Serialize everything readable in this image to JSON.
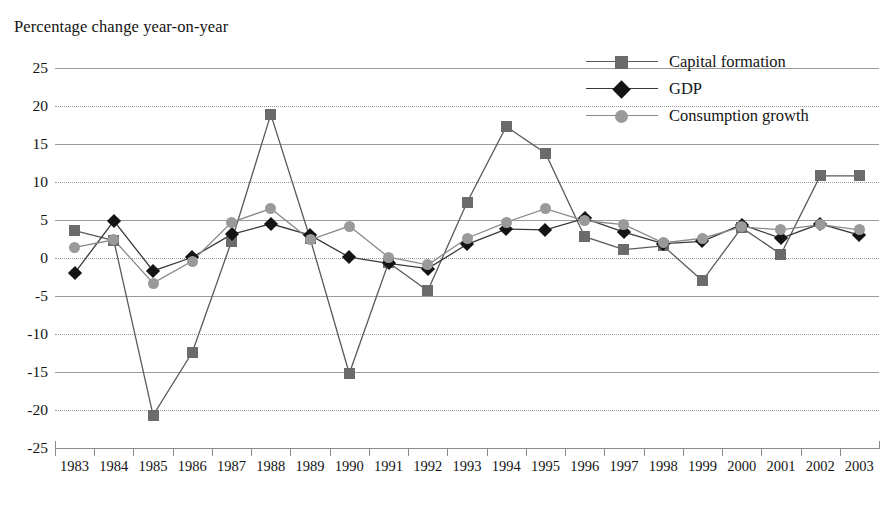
{
  "axis_title": "Percentage change year-on-year",
  "legend": {
    "position": "top-right",
    "items": [
      {
        "label": "Capital formation",
        "marker": "square",
        "color": "#6b6b6b",
        "line_color": "#5a5a5a"
      },
      {
        "label": "GDP",
        "marker": "diamond",
        "color": "#141414",
        "line_color": "#3a3a3a"
      },
      {
        "label": "Consumption growth",
        "marker": "circle",
        "color": "#9a9a9a",
        "line_color": "#8a8a8a"
      }
    ]
  },
  "yaxis": {
    "ticks": [
      "25",
      "20",
      "15",
      "10",
      "5",
      "0",
      "-5",
      "-10",
      "-15",
      "-20",
      "-25"
    ],
    "min": -25,
    "max": 25,
    "step": 5
  },
  "xaxis": {
    "ticks": [
      "1983",
      "1984",
      "1985",
      "1986",
      "1987",
      "1988",
      "1989",
      "1990",
      "1991",
      "1992",
      "1993",
      "1994",
      "1995",
      "1996",
      "1997",
      "1998",
      "1999",
      "2000",
      "2001",
      "2002",
      "2003"
    ]
  },
  "chart_data": {
    "type": "line",
    "title": "Percentage change year-on-year",
    "xlabel": "",
    "ylabel": "Percentage change year-on-year",
    "ylim": [
      -25,
      25
    ],
    "grid": true,
    "legend_position": "top-right",
    "categories": [
      "1983",
      "1984",
      "1985",
      "1986",
      "1987",
      "1988",
      "1989",
      "1990",
      "1991",
      "1992",
      "1993",
      "1994",
      "1995",
      "1996",
      "1997",
      "1998",
      "1999",
      "2000",
      "2001",
      "2002",
      "2003"
    ],
    "series": [
      {
        "name": "Capital formation",
        "marker": "square",
        "color": "#6b6b6b",
        "values": [
          3.6,
          2.3,
          -20.7,
          -12.4,
          2.2,
          18.9,
          2.6,
          -15.2,
          -0.6,
          -4.3,
          7.3,
          17.3,
          13.8,
          2.8,
          1.1,
          1.6,
          -3.0,
          4.0,
          0.5,
          10.8,
          10.8
        ]
      },
      {
        "name": "GDP",
        "marker": "diamond",
        "color": "#141414",
        "values": [
          -2.0,
          4.9,
          -1.7,
          0.1,
          3.1,
          4.5,
          3.0,
          0.1,
          -0.7,
          -1.4,
          1.8,
          3.8,
          3.7,
          5.2,
          3.4,
          1.9,
          2.2,
          4.4,
          2.6,
          4.5,
          3.0
        ]
      },
      {
        "name": "Consumption growth",
        "marker": "circle",
        "color": "#9a9a9a",
        "values": [
          1.4,
          2.4,
          -3.3,
          -0.4,
          4.7,
          6.5,
          2.4,
          4.2,
          0.1,
          -0.9,
          2.6,
          4.7,
          6.5,
          4.9,
          4.4,
          2.0,
          2.6,
          4.1,
          3.7,
          4.4,
          3.7
        ]
      }
    ]
  },
  "colors": {
    "grid": "#9a9a9a",
    "axis": "#8c8c8c",
    "text": "#141414",
    "background": "#ffffff"
  }
}
